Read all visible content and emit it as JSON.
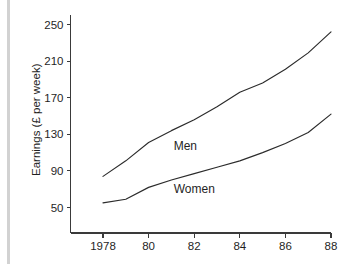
{
  "chart_data": {
    "type": "line",
    "title": "",
    "xlabel": "",
    "ylabel": "Earnings (£ per week)",
    "xlim": [
      1977,
      1988
    ],
    "ylim": [
      40,
      255
    ],
    "grid": false,
    "legend_position": "inline-annotations",
    "x": [
      1978,
      1979,
      1980,
      1981,
      1982,
      1983,
      1984,
      1985,
      1986,
      1987,
      1988
    ],
    "xtick_values": [
      1978,
      1980,
      1982,
      1984,
      1986,
      1988
    ],
    "xtick_labels": [
      "1978",
      "80",
      "82",
      "84",
      "86",
      "88"
    ],
    "ytick_values": [
      50,
      90,
      130,
      170,
      210,
      250
    ],
    "ytick_labels": [
      "50",
      "90",
      "130",
      "170",
      "210",
      "250"
    ],
    "series": [
      {
        "name": "Men",
        "label": "Men",
        "color": "#2b2b2b",
        "values": [
          84,
          101,
          121,
          134,
          146,
          160,
          176,
          186,
          201,
          219,
          242
        ],
        "label_x": 1981.1,
        "label_y": 117
      },
      {
        "name": "Women",
        "label": "Women",
        "color": "#2b2b2b",
        "values": [
          55,
          59,
          72,
          80,
          87,
          94,
          101,
          110,
          120,
          132,
          152
        ],
        "label_x": 1981.1,
        "label_y": 70
      }
    ],
    "annotations": []
  },
  "axes": {
    "y_axis_label": "Earnings (£ per week)"
  }
}
